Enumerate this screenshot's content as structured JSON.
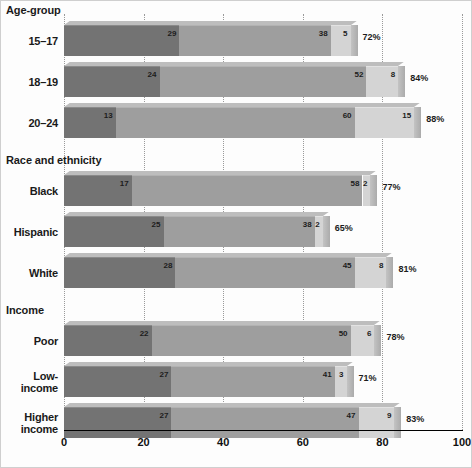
{
  "chart_data": {
    "type": "bar",
    "orientation": "horizontal",
    "stacked": true,
    "title": "",
    "xlabel": "",
    "ylabel": "",
    "xlim": [
      0,
      100
    ],
    "grid": true,
    "legend_position": "none",
    "axis_ticks": [
      "0",
      "20",
      "40",
      "60",
      "80",
      "100"
    ],
    "axis_tick_values": [
      0,
      20,
      40,
      60,
      80,
      100
    ],
    "sections": [
      {
        "heading": "Age-group",
        "rows": [
          {
            "label": "15–17",
            "values": [
              29,
              38,
              5
            ],
            "value_labels": [
              "29",
              "38",
              "5"
            ],
            "total": 72,
            "total_label": "72%"
          },
          {
            "label": "18–19",
            "values": [
              24,
              52,
              8
            ],
            "value_labels": [
              "24",
              "52",
              "8"
            ],
            "total": 84,
            "total_label": "84%"
          },
          {
            "label": "20–24",
            "values": [
              13,
              60,
              15
            ],
            "value_labels": [
              "13",
              "60",
              "15"
            ],
            "total": 88,
            "total_label": "88%"
          }
        ]
      },
      {
        "heading": "Race and ethnicity",
        "rows": [
          {
            "label": "Black",
            "values": [
              17,
              58,
              2
            ],
            "value_labels": [
              "17",
              "58",
              "2"
            ],
            "total": 77,
            "total_label": "77%"
          },
          {
            "label": "Hispanic",
            "values": [
              25,
              38,
              2
            ],
            "value_labels": [
              "25",
              "38",
              "2"
            ],
            "total": 65,
            "total_label": "65%"
          },
          {
            "label": "White",
            "values": [
              28,
              45,
              8
            ],
            "value_labels": [
              "28",
              "45",
              "8"
            ],
            "total": 81,
            "total_label": "81%"
          }
        ]
      },
      {
        "heading": "Income",
        "rows": [
          {
            "label": "Poor",
            "values": [
              22,
              50,
              6
            ],
            "value_labels": [
              "22",
              "50",
              "6"
            ],
            "total": 78,
            "total_label": "78%"
          },
          {
            "label": "Low-\nincome",
            "values": [
              27,
              41,
              3
            ],
            "value_labels": [
              "27",
              "41",
              "3"
            ],
            "total": 71,
            "total_label": "71%"
          },
          {
            "label": "Higher\nincome",
            "values": [
              27,
              47,
              9
            ],
            "value_labels": [
              "27",
              "47",
              "9"
            ],
            "total": 83,
            "total_label": "83%"
          }
        ]
      }
    ],
    "series_colors": [
      "#737373",
      "#9e9e9e",
      "#d4d4d4"
    ]
  }
}
